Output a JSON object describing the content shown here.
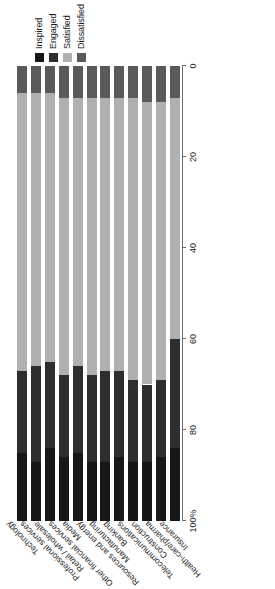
{
  "chart_data": {
    "type": "bar",
    "orientation": "stacked-horizontal",
    "title": "",
    "xlabel": "",
    "ylabel": "",
    "axis_ticks": [
      "100%",
      "80",
      "60",
      "40",
      "20",
      "0"
    ],
    "axis_tick_values": [
      100,
      80,
      60,
      40,
      20,
      0
    ],
    "axis_reversed": true,
    "ylim": [
      0,
      100
    ],
    "grid": false,
    "legend_position": "top-right",
    "legend": [
      "Inspired",
      "Engaged",
      "Satisfied",
      "Dissatisfied"
    ],
    "colors": {
      "Inspired": "#17171a",
      "Engaged": "#2e2e31",
      "Satisfied": "#b0b0b0",
      "Dissatisfied": "#5a5a5d"
    },
    "categories": [
      "Technology",
      "Professional services",
      "Retail / wholesale",
      "Other financial services",
      "Media",
      "Resources and energy",
      "Manufacturing",
      "Banking",
      "Telecommunications",
      "Construction",
      "Health-care/pharma",
      "Insurance"
    ],
    "series": [
      {
        "name": "Inspired",
        "values": [
          15,
          13,
          16,
          14,
          15,
          13,
          13,
          14,
          13,
          13,
          14,
          16
        ]
      },
      {
        "name": "Engaged",
        "values": [
          18,
          21,
          19,
          18,
          19,
          19,
          20,
          19,
          18,
          17,
          17,
          24
        ]
      },
      {
        "name": "Satisfied",
        "values": [
          61,
          60,
          59,
          61,
          59,
          61,
          60,
          60,
          62,
          62,
          61,
          53
        ]
      },
      {
        "name": "Dissatisfied",
        "values": [
          6,
          6,
          6,
          7,
          7,
          7,
          7,
          7,
          7,
          8,
          8,
          7
        ]
      }
    ]
  }
}
